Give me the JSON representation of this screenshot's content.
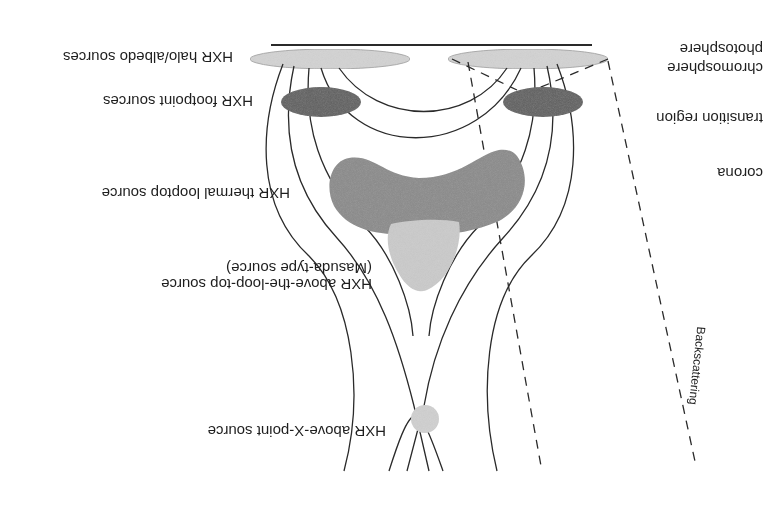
{
  "figure": {
    "orientation": "rotated-180",
    "colors": {
      "halo_albedo": "#d3d3d3",
      "footpoint": "#5e5e5e",
      "thermal_looptop": "#8a8a8a",
      "masuda": "#cbcbcb",
      "above_x_point": "#d0d0d0",
      "lines": "#2a2a2a",
      "text": "#1e1e1e"
    },
    "source_labels": {
      "halo_albedo": "HXR halo/albedo sources",
      "footpoint": "HXR footpoint sources",
      "thermal_looptop": "HXR thermal looptop source",
      "above_loop_top_line1": "HXR above-the-loop-top source",
      "above_loop_top_line2": "(Masuda-type source)",
      "above_x_point": "HXR above-X-point source"
    },
    "layer_labels": {
      "photosphere": "photosphere",
      "chromosphere": "chromosphere",
      "transition_region": "transition region",
      "corona": "corona"
    },
    "annotations": {
      "backscattering": "Backscattering"
    }
  }
}
